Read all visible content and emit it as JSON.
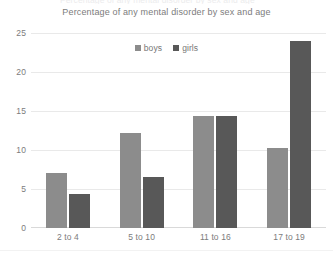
{
  "chart_data": {
    "type": "bar",
    "title": "Percentage of any mental disorder by sex and age",
    "xlabel": "",
    "ylabel": "",
    "categories": [
      "2 to 4",
      "5 to 10",
      "11 to 16",
      "17 to 19"
    ],
    "series": [
      {
        "name": "boys",
        "color": "#8c8c8c",
        "values": [
          7.0,
          12.2,
          14.3,
          10.3
        ]
      },
      {
        "name": "girls",
        "color": "#585858",
        "values": [
          4.3,
          6.6,
          14.3,
          24.0
        ]
      }
    ],
    "ylim": [
      0,
      25
    ],
    "yticks": [
      "0",
      "5",
      "10",
      "15",
      "20",
      "25"
    ],
    "grid": true,
    "legend_position": "top-center"
  },
  "top_sliver_text": "Percentage of any mental disorder by sex and age",
  "colors": {
    "boys": "#8c8c8c",
    "girls": "#585858",
    "grid": "#e9e9e9",
    "text": "#7c7c7c",
    "background": "#ffffff"
  }
}
